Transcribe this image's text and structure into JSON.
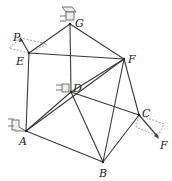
{
  "diagram": {
    "type": "space-truss",
    "nodes": [
      {
        "id": "G",
        "label": "G",
        "x": 70,
        "y": 24,
        "lx": 75,
        "ly": 27
      },
      {
        "id": "E",
        "label": "E",
        "x": 29,
        "y": 53,
        "lx": 16,
        "ly": 65
      },
      {
        "id": "F",
        "label": "F",
        "x": 124,
        "y": 59,
        "lx": 128,
        "ly": 63
      },
      {
        "id": "D",
        "label": "D",
        "x": 71,
        "y": 92,
        "lx": 73,
        "ly": 92
      },
      {
        "id": "A",
        "label": "A",
        "x": 26,
        "y": 131,
        "lx": 19,
        "ly": 145
      },
      {
        "id": "C",
        "label": "C",
        "x": 139,
        "y": 115,
        "lx": 142,
        "ly": 117
      },
      {
        "id": "B",
        "label": "B",
        "x": 103,
        "y": 162,
        "lx": 99,
        "ly": 177
      }
    ],
    "edges": [
      [
        "G",
        "E"
      ],
      [
        "G",
        "F"
      ],
      [
        "G",
        "D"
      ],
      [
        "E",
        "F"
      ],
      [
        "E",
        "A"
      ],
      [
        "F",
        "D"
      ],
      [
        "F",
        "A"
      ],
      [
        "F",
        "B"
      ],
      [
        "F",
        "C"
      ],
      [
        "D",
        "A"
      ],
      [
        "D",
        "B"
      ],
      [
        "D",
        "C"
      ],
      [
        "A",
        "B"
      ],
      [
        "B",
        "C"
      ]
    ],
    "loads": [
      {
        "label": "P",
        "at": "E",
        "lx": 13,
        "ly": 41
      },
      {
        "label": "F",
        "at": "C",
        "lx": 160,
        "ly": 149
      }
    ],
    "supports": [
      "G",
      "D",
      "A"
    ]
  }
}
